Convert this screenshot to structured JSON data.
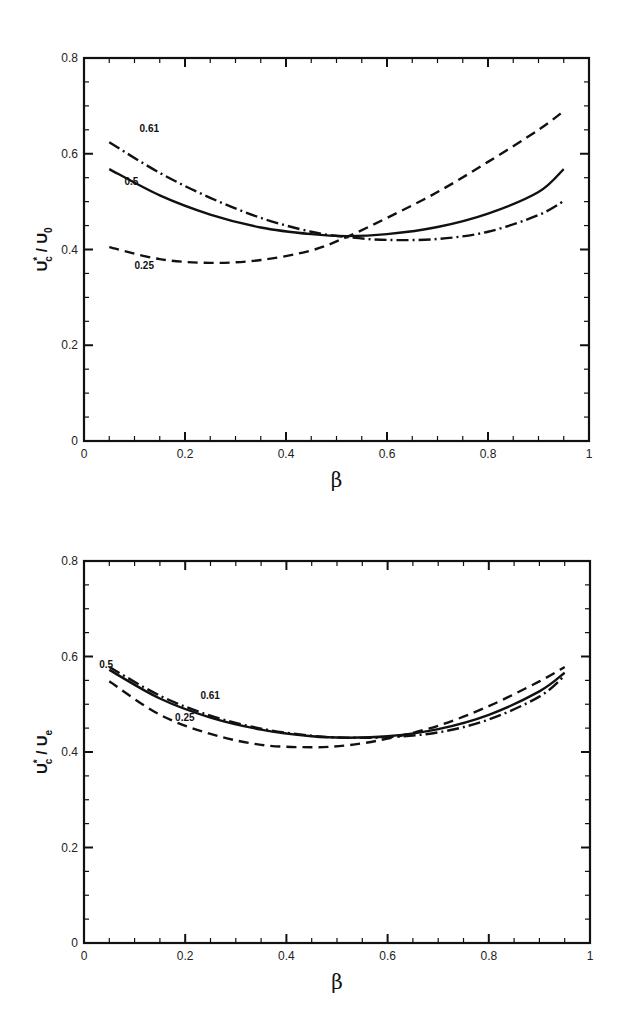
{
  "chart_data": [
    {
      "type": "line",
      "title": "",
      "xlabel": "β",
      "ylabel": "U*c / U0",
      "ylabel_parts": {
        "main": "U",
        "sup": "*",
        "sub": "c",
        "sep": " / ",
        "den": "U",
        "den_sub": "0"
      },
      "xlim": [
        0,
        1
      ],
      "ylim": [
        0,
        0.8
      ],
      "xticks": [
        "0",
        "0.2",
        "0.4",
        "0.6",
        "0.8",
        "1"
      ],
      "yticks": [
        "0",
        "0.2",
        "0.4",
        "0.6",
        "0.8"
      ],
      "grid": false,
      "legend": "inline curve labels",
      "x": [
        0.05,
        0.15,
        0.25,
        0.35,
        0.45,
        0.52,
        0.6,
        0.7,
        0.8,
        0.9,
        0.95
      ],
      "series": [
        {
          "name": "0.25",
          "style": "dashed",
          "values": [
            0.405,
            0.38,
            0.372,
            0.378,
            0.398,
            0.426,
            0.466,
            0.52,
            0.583,
            0.65,
            0.689
          ]
        },
        {
          "name": "0.5",
          "style": "solid",
          "values": [
            0.568,
            0.513,
            0.473,
            0.446,
            0.432,
            0.428,
            0.432,
            0.447,
            0.475,
            0.52,
            0.568
          ]
        },
        {
          "name": "0.61",
          "style": "dashdot",
          "values": [
            0.624,
            0.56,
            0.508,
            0.466,
            0.437,
            0.426,
            0.42,
            0.422,
            0.437,
            0.472,
            0.501
          ]
        }
      ],
      "annotations": [
        {
          "text": "0.61",
          "x": 0.11,
          "y": 0.645
        },
        {
          "text": "0.5",
          "x": 0.08,
          "y": 0.535
        },
        {
          "text": "0.25",
          "x": 0.1,
          "y": 0.36
        }
      ]
    },
    {
      "type": "line",
      "title": "",
      "xlabel": "β",
      "ylabel": "U*c / Ue",
      "ylabel_parts": {
        "main": "U",
        "sup": "*",
        "sub": "c",
        "sep": " / ",
        "den": "U",
        "den_sub": "e"
      },
      "xlim": [
        0,
        1
      ],
      "ylim": [
        0,
        0.8
      ],
      "xticks": [
        "0",
        "0.2",
        "0.4",
        "0.6",
        "0.8",
        "1"
      ],
      "yticks": [
        "0",
        "0.2",
        "0.4",
        "0.6",
        "0.8"
      ],
      "grid": false,
      "legend": "inline curve labels",
      "x": [
        0.05,
        0.15,
        0.25,
        0.35,
        0.45,
        0.52,
        0.6,
        0.7,
        0.8,
        0.9,
        0.95
      ],
      "series": [
        {
          "name": "0.25",
          "style": "dashed",
          "values": [
            0.548,
            0.478,
            0.438,
            0.415,
            0.41,
            0.414,
            0.428,
            0.455,
            0.496,
            0.548,
            0.578
          ]
        },
        {
          "name": "0.5",
          "style": "solid",
          "values": [
            0.572,
            0.512,
            0.472,
            0.447,
            0.433,
            0.43,
            0.433,
            0.448,
            0.478,
            0.527,
            0.566
          ]
        },
        {
          "name": "0.61",
          "style": "dashdot",
          "values": [
            0.578,
            0.518,
            0.476,
            0.449,
            0.434,
            0.43,
            0.431,
            0.441,
            0.468,
            0.516,
            0.56
          ]
        }
      ],
      "annotations": [
        {
          "text": "0.5",
          "x": 0.03,
          "y": 0.575
        },
        {
          "text": "0.61",
          "x": 0.23,
          "y": 0.51
        },
        {
          "text": "0.25",
          "x": 0.18,
          "y": 0.465
        }
      ]
    }
  ]
}
